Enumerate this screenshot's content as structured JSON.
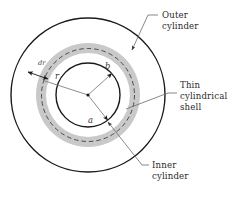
{
  "figure": {
    "background_color": "#ffffff",
    "center": {
      "x": 88,
      "y": 95
    },
    "colors": {
      "outline": "#1a1a1a",
      "shell_band": "#c9c9c9",
      "dashed_circle": "#4a4a4a",
      "leader_line": "#6b6b6b",
      "text": "#2b2b2b",
      "math_text": "#3a3a3a"
    },
    "circles": {
      "outer_cylinder": {
        "radius": 77,
        "stroke": "#1a1a1a",
        "stroke_width": 1.4,
        "style": "solid"
      },
      "shell_band_outer": {
        "radius": 52,
        "fill": "#c9c9c9"
      },
      "shell_band_inner": {
        "radius": 42,
        "fill": "#ffffff"
      },
      "thin_shell_dashed": {
        "radius": 46.5,
        "stroke": "#4a4a4a",
        "stroke_width": 1.0,
        "style": "dashed"
      },
      "inner_cylinder": {
        "radius": 32,
        "stroke": "#1a1a1a",
        "stroke_width": 1.4,
        "style": "solid"
      }
    },
    "radius_labels": [
      {
        "name": "r",
        "text": "r",
        "x": 55,
        "y": 79,
        "target_angle_deg": 198,
        "target_radius": 46.5
      },
      {
        "name": "b",
        "text": "b",
        "x": 105,
        "y": 69,
        "target_angle_deg": 318,
        "target_radius": 32
      },
      {
        "name": "a",
        "text": "a",
        "x": 88,
        "y": 123,
        "target_angle_deg": 52,
        "target_radius": 32
      }
    ],
    "thickness_label": {
      "name": "dr",
      "text": "dr",
      "x": 38,
      "y": 65,
      "arrow_from": {
        "x": 28,
        "y": 72
      },
      "arrow_to": {
        "x": 48,
        "y": 79
      }
    },
    "callouts": [
      {
        "id": "outer-cylinder",
        "lines": [
          "Outer",
          "cylinder"
        ],
        "text_x": 162,
        "text_y": 18,
        "leader_start": {
          "x": 158,
          "y": 15
        },
        "leader_mid": {
          "x": 148,
          "y": 15
        },
        "leader_end": {
          "x": 132,
          "y": 50
        },
        "arrow_at_end": true
      },
      {
        "id": "thin-cylindrical-shell",
        "lines": [
          "Thin",
          "cylindrical",
          "shell"
        ],
        "text_x": 180,
        "text_y": 88,
        "leader_start": {
          "x": 177,
          "y": 93
        },
        "leader_mid": {
          "x": 168,
          "y": 93
        },
        "leader_end": {
          "x": 126,
          "y": 109
        },
        "arrow_at_end": false
      },
      {
        "id": "inner-cylinder",
        "lines": [
          "Inner",
          "cylinder"
        ],
        "text_x": 152,
        "text_y": 168,
        "leader_start": {
          "x": 149,
          "y": 165
        },
        "leader_mid": {
          "x": 142,
          "y": 165
        },
        "leader_end": {
          "x": 108,
          "y": 122
        },
        "arrow_at_end": true
      }
    ]
  }
}
